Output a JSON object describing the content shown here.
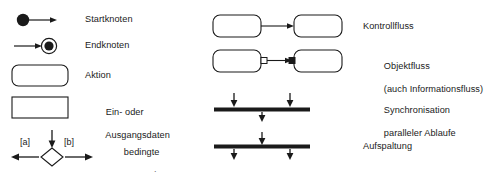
{
  "diagram": {
    "language": "de",
    "background_color": "#ffffff",
    "stroke_color": "#1a1a1a",
    "fill_color": "#ffffff",
    "text_color": "#1a1a1a"
  },
  "left_column": {
    "items": [
      {
        "icon": "start-node-icon",
        "symbol": "filled-circle-with-arrow",
        "label": "Startknoten"
      },
      {
        "icon": "end-node-icon",
        "symbol": "arrow-into-bullseye-circle",
        "label": "Endknoten"
      },
      {
        "icon": "action-node-icon",
        "symbol": "rounded-rectangle",
        "label": "Aktion"
      },
      {
        "icon": "data-node-icon",
        "symbol": "rectangle",
        "label_line1": "Ein- oder",
        "label_line2": "Ausgangsdaten"
      },
      {
        "icon": "decision-node-icon",
        "symbol": "diamond-with-guards",
        "guard_left": "[a]",
        "guard_right": "[b]",
        "label_line1": "bedingte",
        "label_line2": "Verzweigung"
      }
    ]
  },
  "right_column": {
    "items": [
      {
        "icon": "control-flow-icon",
        "symbol": "two-rounded-rectangles-with-arrow",
        "label": "Kontrollfluss"
      },
      {
        "icon": "object-flow-icon",
        "symbol": "two-rounded-rectangles-with-pins-and-arrow",
        "label_line1": "Objektfluss",
        "label_line2": "(auch Informationsfluss)"
      },
      {
        "icon": "join-bar-icon",
        "symbol": "thick-bar-two-arrows-in-one-arrow-out",
        "label_line1": "Synchronisation",
        "label_line2": "paralleler Ablaufe"
      },
      {
        "icon": "fork-bar-icon",
        "symbol": "thick-bar-one-arrow-in-two-arrows-out",
        "label": "Aufspaltung"
      }
    ]
  }
}
